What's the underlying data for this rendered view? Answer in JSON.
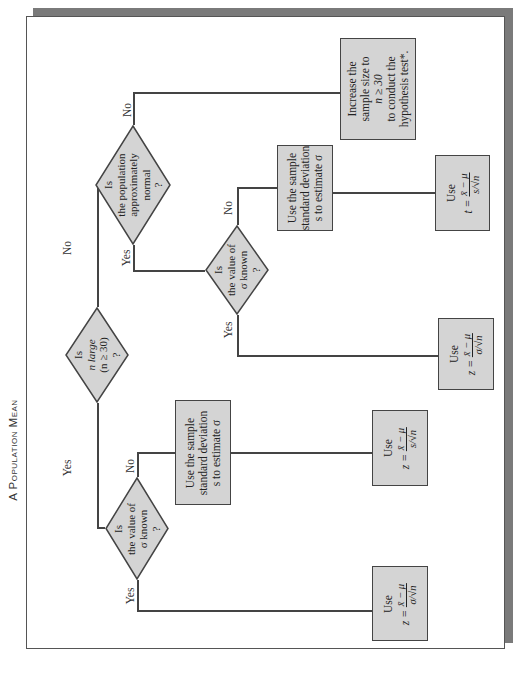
{
  "title": "A Population Mean",
  "orientation": "rotated 90° counter-clockwise",
  "colors": {
    "node_fill": "#d4d4d4",
    "node_border": "#444444",
    "frame_shadow": "#7a7a7a",
    "background": "#ffffff"
  },
  "nodes": {
    "root": {
      "lines": [
        "Is",
        "n large",
        "(n ≥ 30)",
        "?"
      ]
    },
    "left_sigma_known": {
      "lines": [
        "Is",
        "the value of",
        "σ known",
        "?"
      ]
    },
    "left_use_z_sigma": {
      "use": "Use",
      "lhs": "z =",
      "num": "x̄ − μ",
      "den": "σ/√n"
    },
    "left_use_sample_sd": {
      "lines": [
        "Use the sample",
        "standard deviation",
        "s to estimate σ"
      ]
    },
    "left_use_z_s": {
      "use": "Use",
      "lhs": "z =",
      "num": "x̄ − μ",
      "den": "s/√n"
    },
    "right_population_normal": {
      "lines": [
        "Is",
        "the population",
        "approximately",
        "normal",
        "?"
      ]
    },
    "right_increase_sample": {
      "lines": [
        "Increase the",
        "sample size to",
        "n ≥ 30",
        "to conduct the",
        "hypothesis test*."
      ]
    },
    "right_sigma_known": {
      "lines": [
        "Is",
        "the value of",
        "σ known",
        "?"
      ]
    },
    "right_use_z_sigma": {
      "use": "Use",
      "lhs": "z =",
      "num": "x̄ − μ",
      "den": "σ/√n"
    },
    "right_use_sample_sd": {
      "lines": [
        "Use the sample",
        "standard deviation",
        "s to estimate σ"
      ]
    },
    "right_use_t": {
      "use": "Use",
      "lhs": "t =",
      "num": "x̄ − μ",
      "den": "s/√n"
    }
  },
  "edges": {
    "root_yes": "Yes",
    "root_no": "No",
    "left_sigma_yes": "Yes",
    "left_sigma_no": "No",
    "normal_yes": "Yes",
    "normal_no": "No",
    "right_sigma_yes": "Yes",
    "right_sigma_no": "No"
  }
}
